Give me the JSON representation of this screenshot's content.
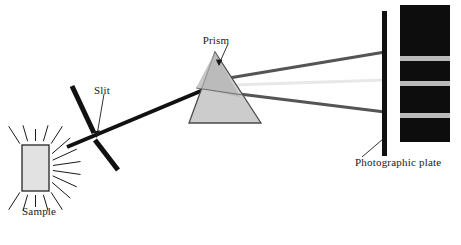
{
  "figure": {
    "background_color": "#ffffff"
  },
  "labels": {
    "sample": "Sample",
    "slit": "Slit",
    "prism": "Prism",
    "photographic_plate": "Photographic plate"
  },
  "colors": {
    "ink": "#1a1a1a",
    "beam": "#111111",
    "ray_dark": "#555555",
    "ray_faint": "#e8e8e8",
    "prism_fill": "#cccccc",
    "prism_top_fill": "#b5b5b5",
    "prism_stroke": "#4a4a4a",
    "sample_fill": "#e2e2e2",
    "sample_stroke": "#333333",
    "plate_bar": "#111111",
    "spectrum_dark": "#0d0d0d",
    "spectrum_gap": "#b9b9b9"
  },
  "components": {
    "sample": {
      "name": "sample",
      "x": 22,
      "y": 145,
      "width": 27,
      "height": 46,
      "emission_ray_count": 22
    },
    "slit": {
      "name": "slit",
      "upper_bar": {
        "x1": 72,
        "y1": 86,
        "x2": 94,
        "y2": 133
      },
      "lower_bar": {
        "x1": 95,
        "y1": 140,
        "x2": 118,
        "y2": 170
      },
      "gap_center": {
        "x": 96,
        "y": 137
      }
    },
    "beam": {
      "name": "incident-beam",
      "from": {
        "x": 67,
        "y": 147
      },
      "to": {
        "x": 208,
        "y": 88
      },
      "width": 4
    },
    "prism": {
      "name": "prism",
      "apex": {
        "x": 215,
        "y": 52
      },
      "bottom_left": {
        "x": 189,
        "y": 123
      },
      "bottom_right": {
        "x": 261,
        "y": 123
      },
      "refraction_point": {
        "x": 196,
        "y": 88
      }
    },
    "dispersed_rays": [
      {
        "name": "ray-upper",
        "color": "#555555",
        "from": {
          "x": 205,
          "y": 82
        },
        "to": {
          "x": 385,
          "y": 52
        },
        "width": 3
      },
      {
        "name": "ray-middle",
        "color": "#e8e8e8",
        "from": {
          "x": 203,
          "y": 86
        },
        "to": {
          "x": 385,
          "y": 80
        },
        "width": 3
      },
      {
        "name": "ray-lower",
        "color": "#555555",
        "from": {
          "x": 207,
          "y": 90
        },
        "to": {
          "x": 385,
          "y": 112
        },
        "width": 3
      }
    ],
    "photographic_plate": {
      "name": "photographic-plate",
      "bar": {
        "x": 382,
        "y": 11,
        "width": 5,
        "height": 145
      },
      "pointer": {
        "x1": 362,
        "y1": 157,
        "x2": 383,
        "y2": 139
      }
    },
    "spectrum": {
      "name": "spectrum-strip",
      "x": 400,
      "y": 5,
      "width": 50,
      "height": 137,
      "bands": [
        {
          "index": 0,
          "type": "dark",
          "y_start": 5,
          "y_end": 56
        },
        {
          "index": 1,
          "type": "gap",
          "y_start": 56,
          "y_end": 61
        },
        {
          "index": 2,
          "type": "dark",
          "y_start": 61,
          "y_end": 81
        },
        {
          "index": 3,
          "type": "gap",
          "y_start": 81,
          "y_end": 86
        },
        {
          "index": 4,
          "type": "dark",
          "y_start": 86,
          "y_end": 113
        },
        {
          "index": 5,
          "type": "gap",
          "y_start": 113,
          "y_end": 118
        },
        {
          "index": 6,
          "type": "dark",
          "y_start": 118,
          "y_end": 142
        }
      ]
    }
  },
  "leaders": {
    "prism_pointer": {
      "x1": 228,
      "y1": 44,
      "x2": 219,
      "y2": 64
    },
    "slit_pointer": {
      "x1": 104,
      "y1": 94,
      "x2": 97,
      "y2": 135
    }
  },
  "label_positions": {
    "sample": {
      "x": 22,
      "y": 215
    },
    "slit": {
      "x": 94,
      "y": 94
    },
    "prism": {
      "x": 216,
      "y": 44
    },
    "photographic_plate": {
      "x": 355,
      "y": 166
    }
  }
}
